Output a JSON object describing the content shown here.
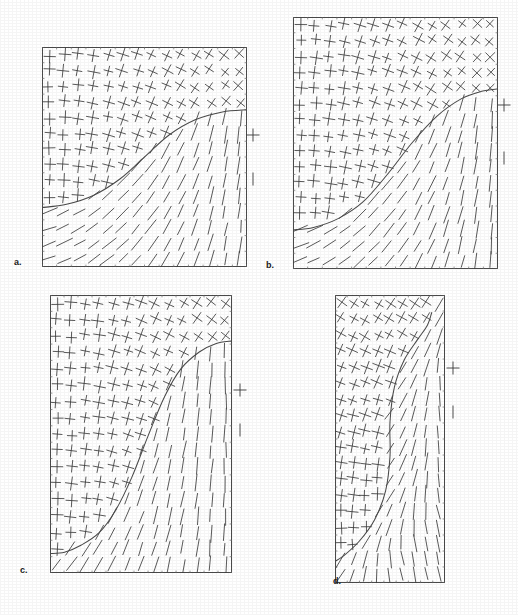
{
  "figure": {
    "width": 518,
    "height": 615,
    "background": "#ffffff",
    "ink_color": "#3c3c3c",
    "curve_color": "#4a4a4a",
    "frame_color": "#4a4a4a"
  },
  "panels": [
    {
      "id": "a",
      "label": "a.",
      "label_x": 14,
      "label_y": 258,
      "x": 42,
      "y": 47,
      "width": 205,
      "height": 220,
      "glyph_cols": 14,
      "glyph_rows": 14,
      "cross_length": 13,
      "tick_length": 16,
      "boundary": "shallow-s-curve-low",
      "curve_points": "0,0.73 0.12,0.715 0.25,0.675 0.38,0.60 0.50,0.50 0.62,0.40 0.75,0.33 0.88,0.295 1,0.285",
      "upper_region": "crosses",
      "lower_region": "single-ticks",
      "upper_rotation_start": 0,
      "upper_rotation_end": 42,
      "lower_rotation_start": 72,
      "lower_rotation_end": 4,
      "legend": [
        {
          "type": "cross",
          "x": 253,
          "y": 135,
          "size": 13
        },
        {
          "type": "tick",
          "x": 253,
          "y": 179,
          "size": 13
        }
      ]
    },
    {
      "id": "b",
      "label": "b.",
      "label_x": 266,
      "label_y": 261,
      "x": 293,
      "y": 17,
      "width": 205,
      "height": 252,
      "glyph_cols": 14,
      "glyph_rows": 16,
      "cross_length": 13,
      "tick_length": 16,
      "boundary": "s-curve-mid",
      "curve_points": "0,0.845 0.10,0.835 0.22,0.80 0.34,0.735 0.46,0.625 0.58,0.50 0.70,0.395 0.82,0.325 0.92,0.295 1,0.285",
      "upper_region": "crosses",
      "lower_region": "single-ticks",
      "upper_rotation_start": 0,
      "upper_rotation_end": 45,
      "lower_rotation_start": 70,
      "lower_rotation_end": 2,
      "legend": [
        {
          "type": "cross",
          "x": 504,
          "y": 105,
          "size": 13
        },
        {
          "type": "tick",
          "x": 504,
          "y": 158,
          "size": 13
        }
      ]
    },
    {
      "id": "c",
      "label": "c.",
      "label_x": 20,
      "label_y": 566,
      "x": 50,
      "y": 295,
      "width": 182,
      "height": 278,
      "glyph_cols": 13,
      "glyph_rows": 17,
      "cross_length": 13,
      "tick_length": 16,
      "boundary": "steep-s-curve",
      "curve_points": "0,0.93 0.08,0.925 0.17,0.90 0.27,0.855 0.36,0.775 0.45,0.655 0.54,0.505 0.63,0.365 0.72,0.265 0.82,0.205 0.91,0.175 1,0.165",
      "upper_region": "crosses",
      "lower_region": "single-ticks",
      "upper_rotation_start": 0,
      "upper_rotation_end": 40,
      "lower_rotation_start": 40,
      "lower_rotation_end": 0,
      "legend": [
        {
          "type": "cross",
          "x": 240,
          "y": 390,
          "size": 13
        },
        {
          "type": "tick",
          "x": 240,
          "y": 430,
          "size": 13
        }
      ]
    },
    {
      "id": "d",
      "label": "d.",
      "label_x": 333,
      "label_y": 577,
      "x": 335,
      "y": 295,
      "width": 110,
      "height": 288,
      "glyph_cols": 9,
      "glyph_rows": 18,
      "cross_length": 13,
      "tick_length": 16,
      "boundary": "vertical-s-curve",
      "curve_points": "0.88,0.06 0.84,0.105 0.75,0.155 0.63,0.225 0.54,0.32 0.50,0.44 0.50,0.56 0.46,0.68 0.36,0.78 0.22,0.855 0.08,0.905 0,0.925",
      "upper_region": "crosses",
      "lower_region": "single-ticks",
      "upper_rotation_start": 0,
      "upper_rotation_end": 42,
      "lower_rotation_start": 35,
      "lower_rotation_end": -12,
      "legend": [
        {
          "type": "cross",
          "x": 453,
          "y": 368,
          "size": 13
        },
        {
          "type": "tick",
          "x": 453,
          "y": 412,
          "size": 13
        }
      ]
    }
  ],
  "chart_data": {
    "type": "scatter",
    "title": "",
    "xlabel": "",
    "ylabel": "",
    "panel_labels": [
      "a.",
      "b.",
      "c.",
      "d."
    ],
    "series": [
      {
        "name": "a boundary",
        "x": [
          0,
          0.12,
          0.25,
          0.38,
          0.5,
          0.62,
          0.75,
          0.88,
          1
        ],
        "values": [
          0.73,
          0.715,
          0.675,
          0.6,
          0.5,
          0.4,
          0.33,
          0.295,
          0.285
        ]
      },
      {
        "name": "b boundary",
        "x": [
          0,
          0.1,
          0.22,
          0.34,
          0.46,
          0.58,
          0.7,
          0.82,
          0.92,
          1
        ],
        "values": [
          0.845,
          0.835,
          0.8,
          0.735,
          0.625,
          0.5,
          0.395,
          0.325,
          0.295,
          0.285
        ]
      },
      {
        "name": "c boundary",
        "x": [
          0,
          0.08,
          0.17,
          0.27,
          0.36,
          0.45,
          0.54,
          0.63,
          0.72,
          0.82,
          0.91,
          1
        ],
        "values": [
          0.93,
          0.925,
          0.9,
          0.855,
          0.775,
          0.655,
          0.505,
          0.365,
          0.265,
          0.205,
          0.175,
          0.165
        ]
      },
      {
        "name": "d boundary",
        "x": [
          0.88,
          0.84,
          0.75,
          0.63,
          0.54,
          0.5,
          0.5,
          0.46,
          0.36,
          0.22,
          0.08,
          0
        ],
        "values": [
          0.06,
          0.105,
          0.155,
          0.225,
          0.32,
          0.44,
          0.56,
          0.68,
          0.78,
          0.855,
          0.905,
          0.925
        ]
      }
    ],
    "grid": false,
    "legend_position": "right-of-each-panel"
  }
}
